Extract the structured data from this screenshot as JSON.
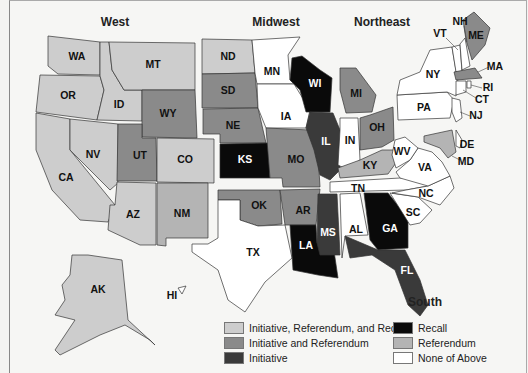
{
  "credit": "© CENGAGE LEARNING",
  "regions": [
    {
      "name": "West",
      "x": 115,
      "y": 26
    },
    {
      "name": "Midwest",
      "x": 276,
      "y": 26
    },
    {
      "name": "Northeast",
      "x": 382,
      "y": 26
    },
    {
      "name": "South",
      "x": 425,
      "y": 306
    }
  ],
  "categories": {
    "irr": {
      "label": "Initiative, Referendum, and Recall",
      "color": "#cdcdcd"
    },
    "ir": {
      "label": "Initiative and Referendum",
      "color": "#8a8a8a"
    },
    "i": {
      "label": "Initiative",
      "color": "#3a3a3a"
    },
    "recall": {
      "label": "Recall",
      "color": "#0a0a0a"
    },
    "ref": {
      "label": "Referendum",
      "color": "#b4b4b4"
    },
    "none": {
      "label": "None of Above",
      "color": "#ffffff"
    }
  },
  "legend": [
    {
      "key": "irr",
      "label": "Initiative, Referendum, and Recall"
    },
    {
      "key": "ir",
      "label": "Initiative and Referendum"
    },
    {
      "key": "i",
      "label": "Initiative"
    },
    {
      "key": "recall",
      "label": "Recall"
    },
    {
      "key": "ref",
      "label": "Referendum"
    },
    {
      "key": "none",
      "label": "None of Above"
    }
  ],
  "states": [
    {
      "abbr": "WA",
      "cat": "irr",
      "pts": "48,36 100,42 100,75 58,74 48,66",
      "lx": 77,
      "ly": 57
    },
    {
      "abbr": "OR",
      "cat": "irr",
      "pts": "40,75 100,76 104,90 97,120 36,112",
      "lx": 68,
      "ly": 96
    },
    {
      "abbr": "CA",
      "cat": "irr",
      "pts": "36,113 70,119 70,150 115,205 108,222 80,220 52,190 36,150",
      "lx": 66,
      "ly": 178
    },
    {
      "abbr": "ID",
      "cat": "irr",
      "pts": "100,42 109,42 112,70 124,90 142,90 142,121 97,120 104,90 100,76",
      "lx": 119,
      "ly": 105
    },
    {
      "abbr": "NV",
      "cat": "irr",
      "pts": "70,119 118,124 118,183 110,190 70,150",
      "lx": 93,
      "ly": 155
    },
    {
      "abbr": "MT",
      "cat": "irr",
      "pts": "109,42 195,43 195,90 142,90 124,90 112,70",
      "lx": 153,
      "ly": 65
    },
    {
      "abbr": "WY",
      "cat": "ir",
      "pts": "142,90 195,90 197,138 142,137",
      "lx": 168,
      "ly": 114
    },
    {
      "abbr": "UT",
      "cat": "ir",
      "pts": "118,124 142,124 142,138 156,138 157,181 117,181",
      "lx": 140,
      "ly": 156
    },
    {
      "abbr": "CO",
      "cat": "irr",
      "pts": "157,138 214,139 214,183 157,182",
      "lx": 185,
      "ly": 160
    },
    {
      "abbr": "AZ",
      "cat": "irr",
      "pts": "117,182 156,183 156,245 140,245 108,230 110,205 115,205",
      "lx": 133,
      "ly": 215
    },
    {
      "abbr": "NM",
      "cat": "ref",
      "pts": "157,183 208,183 208,238 166,238 166,246 157,245",
      "lx": 182,
      "ly": 214
    },
    {
      "abbr": "ND",
      "cat": "irr",
      "pts": "202,39 252,40 255,73 202,74",
      "lx": 228,
      "ly": 57
    },
    {
      "abbr": "SD",
      "cat": "ir",
      "pts": "202,74 255,73 258,108 202,108",
      "lx": 228,
      "ly": 91
    },
    {
      "abbr": "NE",
      "cat": "ir",
      "pts": "203,109 258,108 266,143 220,143 220,134 203,134",
      "lx": 233,
      "ly": 126
    },
    {
      "abbr": "KS",
      "cat": "recall",
      "pts": "220,144 268,143 270,178 220,178",
      "lx": 245,
      "ly": 160
    },
    {
      "abbr": "OK",
      "cat": "ir",
      "pts": "218,190 280,190 282,224 258,226 240,220 240,200 218,200",
      "lx": 259,
      "ly": 206
    },
    {
      "abbr": "TX",
      "cat": "none",
      "pts": "218,200 240,200 240,220 258,226 285,225 292,258 265,282 245,312 228,300 218,270 192,252 192,244 208,244 218,238",
      "lx": 253,
      "ly": 253
    },
    {
      "abbr": "MN",
      "cat": "none",
      "pts": "252,40 300,37 288,55 290,80 294,84 257,84 255,73",
      "lx": 272,
      "ly": 72
    },
    {
      "abbr": "IA",
      "cat": "none",
      "pts": "257,84 294,84 310,110 306,128 266,128 258,108",
      "lx": 286,
      "ly": 117
    },
    {
      "abbr": "MO",
      "cat": "ir",
      "pts": "266,128 310,130 318,154 320,187 283,187 282,178 270,178",
      "lx": 296,
      "ly": 160
    },
    {
      "abbr": "AR",
      "cat": "ir",
      "pts": "280,190 320,189 316,225 290,225 285,225",
      "lx": 303,
      "ly": 211
    },
    {
      "abbr": "LA",
      "cat": "recall",
      "pts": "290,225 316,225 317,243 333,244 338,278 318,275 293,270",
      "lx": 306,
      "ly": 246
    },
    {
      "abbr": "WI",
      "cat": "recall",
      "pts": "292,58 302,56 320,70 332,78 330,112 306,112 300,90 290,80",
      "lx": 315,
      "ly": 84
    },
    {
      "abbr": "IL",
      "cat": "i",
      "pts": "310,112 333,113 340,130 340,170 330,180 320,175 314,150 306,128",
      "lx": 326,
      "ly": 142
    },
    {
      "abbr": "MI",
      "cat": "ir",
      "pts": "340,68 356,68 376,95 372,112 346,113 340,90",
      "lx": 356,
      "ly": 94
    },
    {
      "abbr": "IN",
      "cat": "none",
      "pts": "340,118 358,118 360,160 348,170 338,165 340,130",
      "lx": 350,
      "ly": 141
    },
    {
      "abbr": "OH",
      "cat": "ir",
      "pts": "360,118 370,115 393,107 394,140 382,147 360,150",
      "lx": 377,
      "ly": 128
    },
    {
      "abbr": "KY",
      "cat": "ref",
      "pts": "338,168 360,160 382,150 394,150 398,160 388,174 340,178",
      "lx": 370,
      "ly": 166
    },
    {
      "abbr": "TN",
      "cat": "none",
      "pts": "330,182 400,178 438,175 428,186 406,190 330,192",
      "lx": 358,
      "ly": 189
    },
    {
      "abbr": "MS",
      "cat": "i",
      "pts": "318,194 337,194 340,255 320,255 317,243",
      "lx": 328,
      "ly": 233
    },
    {
      "abbr": "AL",
      "cat": "none",
      "pts": "340,194 360,193 368,235 345,236 342,258",
      "lx": 356,
      "ly": 230
    },
    {
      "abbr": "GA",
      "cat": "recall",
      "pts": "364,193 388,193 408,218 408,248 378,250 370,240",
      "lx": 390,
      "ly": 229
    },
    {
      "abbr": "FL",
      "cat": "i",
      "pts": "345,236 378,250 405,250 420,280 428,305 420,316 408,305 395,270 372,255 350,258",
      "lx": 407,
      "ly": 271
    },
    {
      "abbr": "SC",
      "cat": "none",
      "pts": "390,193 418,197 432,210 420,223 410,225",
      "lx": 413,
      "ly": 213
    },
    {
      "abbr": "NC",
      "cat": "none",
      "pts": "406,190 428,186 450,176 454,188 440,205 418,197 392,193",
      "lx": 426,
      "ly": 194
    },
    {
      "abbr": "VA",
      "cat": "none",
      "pts": "396,172 410,160 418,148 432,152 442,162 450,176 428,186 400,178",
      "lx": 425,
      "ly": 168
    },
    {
      "abbr": "WV",
      "cat": "none",
      "pts": "395,140 405,137 418,148 410,160 396,168 392,155",
      "lx": 402,
      "ly": 152
    },
    {
      "abbr": "PA",
      "cat": "none",
      "pts": "397,95 447,92 454,100 450,118 398,120",
      "lx": 424,
      "ly": 108
    },
    {
      "abbr": "NY",
      "cat": "none",
      "pts": "400,80 420,72 430,50 452,47 455,65 458,82 456,96 447,92 397,95",
      "lx": 433,
      "ly": 75
    },
    {
      "abbr": "VT",
      "cat": "none",
      "pts": "452,47 460,45 462,72 456,72",
      "lx": 458,
      "ly": 58
    },
    {
      "abbr": "NH",
      "cat": "none",
      "pts": "460,44 465,38 470,66 462,70",
      "lx": 465,
      "ly": 55
    },
    {
      "abbr": "ME",
      "cat": "ir",
      "pts": "463,20 474,12 490,28 485,45 472,60 466,40",
      "lx": 476,
      "ly": 36
    },
    {
      "abbr": "MA",
      "cat": "ir",
      "pts": "454,72 475,68 482,78 456,80",
      "lx": 467,
      "ly": 75
    },
    {
      "abbr": "CT",
      "cat": "none",
      "pts": "456,81 466,81 466,92 456,95",
      "lx": 461,
      "ly": 88
    },
    {
      "abbr": "RI",
      "cat": "none",
      "pts": "467,81 471,81 471,88 467,88",
      "lx": 469,
      "ly": 85
    },
    {
      "abbr": "NJ",
      "cat": "none",
      "pts": "452,98 460,100 462,118 456,122 452,112",
      "lx": 457,
      "ly": 110
    },
    {
      "abbr": "DE",
      "cat": "none",
      "pts": "456,130 462,140 460,148 456,146",
      "lx": 459,
      "ly": 140
    },
    {
      "abbr": "MD",
      "cat": "ref",
      "pts": "424,136 452,130 456,152 448,158 440,148 424,142",
      "lx": 440,
      "ly": 142
    },
    {
      "abbr": "AK",
      "cat": "irr",
      "pts": "72,255 88,255 122,260 128,320 155,345 150,340 125,325 100,335 60,355 55,350 75,320 55,315 65,300 62,285 70,275",
      "lx": 98,
      "ly": 290
    },
    {
      "abbr": "HI",
      "cat": "none",
      "pts": "178,288 186,286 182,294",
      "lx": 172,
      "ly": 296
    }
  ],
  "external_labels": [
    {
      "abbr": "NH",
      "x": 460,
      "y": 22,
      "lx1": 464,
      "ly1": 26,
      "lx2": 467,
      "ly2": 42
    },
    {
      "abbr": "VT",
      "x": 440,
      "y": 34,
      "lx1": 446,
      "ly1": 38,
      "lx2": 458,
      "ly2": 50
    },
    {
      "abbr": "MA",
      "x": 495,
      "y": 67,
      "lx1": 489,
      "ly1": 67,
      "lx2": 478,
      "ly2": 72
    },
    {
      "abbr": "RI",
      "x": 488,
      "y": 88,
      "lx1": 482,
      "ly1": 88,
      "lx2": 471,
      "ly2": 85
    },
    {
      "abbr": "CT",
      "x": 482,
      "y": 100,
      "lx1": 476,
      "ly1": 98,
      "lx2": 463,
      "ly2": 90
    },
    {
      "abbr": "NJ",
      "x": 476,
      "y": 116,
      "lx1": 470,
      "ly1": 116,
      "lx2": 460,
      "ly2": 112
    },
    {
      "abbr": "DE",
      "x": 467,
      "y": 145,
      "lx1": 462,
      "ly1": 145,
      "lx2": 460,
      "ly2": 145
    },
    {
      "abbr": "MD",
      "x": 466,
      "y": 162,
      "lx1": 460,
      "ly1": 160,
      "lx2": 452,
      "ly2": 156
    }
  ]
}
